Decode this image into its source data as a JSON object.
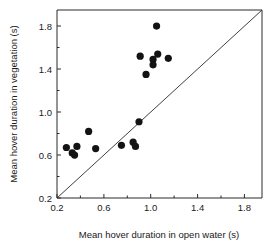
{
  "chart_data": {
    "type": "scatter",
    "title": "",
    "subtitle": "",
    "xlabel": "Mean hover duration in open water (s)",
    "ylabel": "Mean hover duration in vegetation (s)",
    "xlim": [
      0.2,
      1.95
    ],
    "ylim": [
      0.2,
      1.95
    ],
    "xticks": [
      0.2,
      0.6,
      1.0,
      1.4,
      1.8
    ],
    "yticks": [
      0.2,
      0.6,
      1.0,
      1.4,
      1.8
    ],
    "xtick_labels": [
      "0.2",
      "0.6",
      "1.0",
      "1.4",
      "1.8"
    ],
    "ytick_labels": [
      "0.2",
      "0.6",
      "1.0",
      "1.4",
      "1.8"
    ],
    "grid": false,
    "legend": null,
    "marker": "filled-circle",
    "marker_color": "#131313",
    "annotations": [
      {
        "name": "identity-line",
        "type": "line",
        "description": "1:1 reference diagonal from (0.2,0.2) to (1.95,1.95)",
        "from": [
          0.2,
          0.2
        ],
        "to": [
          1.95,
          1.95
        ]
      }
    ],
    "points": [
      {
        "x": 0.28,
        "y": 0.67
      },
      {
        "x": 0.33,
        "y": 0.62
      },
      {
        "x": 0.35,
        "y": 0.6
      },
      {
        "x": 0.37,
        "y": 0.68
      },
      {
        "x": 0.47,
        "y": 0.82
      },
      {
        "x": 0.53,
        "y": 0.66
      },
      {
        "x": 0.75,
        "y": 0.69
      },
      {
        "x": 0.85,
        "y": 0.72
      },
      {
        "x": 0.87,
        "y": 0.68
      },
      {
        "x": 0.9,
        "y": 0.91
      },
      {
        "x": 0.91,
        "y": 1.52
      },
      {
        "x": 0.96,
        "y": 1.35
      },
      {
        "x": 1.02,
        "y": 1.49
      },
      {
        "x": 1.02,
        "y": 1.44
      },
      {
        "x": 1.06,
        "y": 1.54
      },
      {
        "x": 1.05,
        "y": 1.8
      },
      {
        "x": 1.15,
        "y": 1.5
      }
    ]
  },
  "axes": {
    "x_title": "Mean hover duration in open water (s)",
    "y_title": "Mean hover duration in vegetation (s)"
  }
}
